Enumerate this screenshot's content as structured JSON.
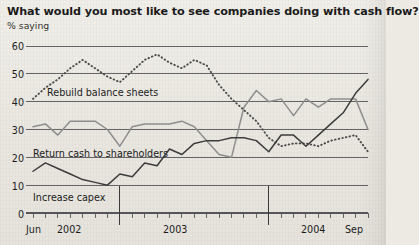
{
  "header": {
    "title": "What would you most like to see companies doing with cash flow?",
    "subtitle": "% saying"
  },
  "chart_data": {
    "type": "line",
    "title": "What would you most like to see companies doing with cash flow?",
    "subtitle": "% saying",
    "xlabel": "",
    "ylabel": "% saying",
    "ylim": [
      0,
      60
    ],
    "yticks": [
      0,
      10,
      20,
      30,
      40,
      50,
      60
    ],
    "grid": true,
    "legend": "inline-annotations",
    "x": [
      "Jun 2002",
      "Jul 2002",
      "Aug 2002",
      "Sep 2002",
      "Oct 2002",
      "Nov 2002",
      "Dec 2002",
      "Jan 2003",
      "Feb 2003",
      "Mar 2003",
      "Apr 2003",
      "May 2003",
      "Jun 2003",
      "Jul 2003",
      "Aug 2003",
      "Sep 2003",
      "Oct 2003",
      "Nov 2003",
      "Dec 2003",
      "Jan 2004",
      "Feb 2004",
      "Mar 2004",
      "Apr 2004",
      "May 2004",
      "Jun 2004",
      "Jul 2004",
      "Aug 2004",
      "Sep 2004"
    ],
    "xtick_labels": [
      {
        "label": "Jun",
        "x_index": 0
      },
      {
        "label": "2002",
        "x_index": 3
      },
      {
        "label": "2003",
        "x_index": 12
      },
      {
        "label": "2004",
        "x_index": 23
      },
      {
        "label": "Sep",
        "x_index": 27
      }
    ],
    "year_dividers": [
      "Jan 2003",
      "Jan 2004"
    ],
    "series": [
      {
        "name": "Rebuild balance sheets",
        "style": "dotted",
        "color": "#4a4a4a",
        "values": [
          41,
          45,
          48,
          52,
          55,
          52,
          49,
          47,
          51,
          55,
          57,
          54,
          52,
          55,
          53,
          46,
          41,
          37,
          33,
          27,
          24,
          25,
          25,
          24,
          26,
          27,
          28,
          22
        ]
      },
      {
        "name": "Return cash to shareholders",
        "style": "solid",
        "color": "#8e8e8e",
        "values": [
          31,
          32,
          28,
          33,
          33,
          33,
          30,
          24,
          31,
          32,
          32,
          32,
          33,
          31,
          26,
          21,
          20,
          38,
          44,
          40,
          41,
          35,
          41,
          38,
          41,
          41,
          41,
          30
        ]
      },
      {
        "name": "Increase capex",
        "style": "solid",
        "color": "#3c3c3c",
        "values": [
          15,
          18,
          16,
          14,
          12,
          11,
          10,
          14,
          13,
          18,
          17,
          23,
          21,
          25,
          26,
          26,
          27,
          27,
          26,
          22,
          28,
          28,
          24,
          28,
          32,
          36,
          43,
          48
        ]
      }
    ]
  },
  "axis": {
    "y_ticks": [
      "60",
      "50",
      "40",
      "30",
      "20",
      "10",
      "0"
    ],
    "x_ticks": [
      "Jun",
      "2002",
      "2003",
      "2004",
      "Sep"
    ]
  },
  "annotations": [
    {
      "key": "rebuild",
      "label": "Rebuild balance sheets"
    },
    {
      "key": "return",
      "label": "Return cash to shareholders"
    },
    {
      "key": "capex",
      "label": "Increase capex"
    }
  ],
  "colors": {
    "paper": "#edeae4",
    "ink": "#1b1b1b",
    "grid": "#55555a",
    "rebuild": "#4a4a4a",
    "return": "#8e8e8e",
    "capex": "#3c3c3c"
  }
}
